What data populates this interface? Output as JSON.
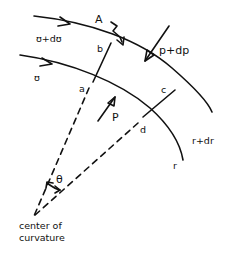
{
  "diagram": {
    "type": "fluid streamline element on curved path",
    "labels": {
      "outer_velocity": "ʊ+dʊ",
      "inner_velocity": "ʊ",
      "area": "A",
      "corner_a": "a",
      "corner_b": "b",
      "corner_c": "c",
      "corner_d": "d",
      "pressure_inner": "P",
      "pressure_outer": "p+dp",
      "radius_outer": "r+dr",
      "radius_inner": "r",
      "angle": "θ",
      "center_line1": "center of",
      "center_line2": "curvature"
    },
    "colors": {
      "ink": "#111111",
      "background": "#ffffff"
    }
  }
}
